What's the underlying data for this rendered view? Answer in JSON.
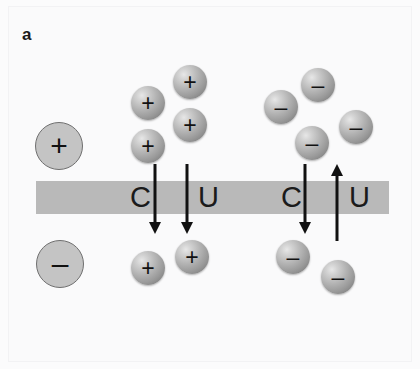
{
  "figure": {
    "panel_letter": "a",
    "background_color": "#fafafb",
    "membrane": {
      "label": "membrane",
      "color": "#b9b9b9",
      "x": 36,
      "y": 181,
      "width": 353,
      "height": 33
    }
  },
  "pathway_labels": [
    {
      "id": "left-c",
      "text": "C",
      "x": 130,
      "y": 183
    },
    {
      "id": "left-u",
      "text": "U",
      "x": 198,
      "y": 183
    },
    {
      "id": "right-c",
      "text": "C",
      "x": 281,
      "y": 183
    },
    {
      "id": "right-u",
      "text": "U",
      "x": 349,
      "y": 183
    }
  ],
  "arrows": [
    {
      "id": "arrow-left-c",
      "direction": "down",
      "x": 155,
      "y_top": 164,
      "y_bottom": 234
    },
    {
      "id": "arrow-left-u",
      "direction": "down",
      "x": 187,
      "y_top": 164,
      "y_bottom": 234
    },
    {
      "id": "arrow-right-c",
      "direction": "down",
      "x": 305,
      "y_top": 164,
      "y_bottom": 234
    },
    {
      "id": "arrow-right-u",
      "direction": "up",
      "x": 337,
      "y_top": 164,
      "y_bottom": 241
    }
  ],
  "ions": [
    {
      "id": "reservoir-positive",
      "charge": "+",
      "symbol": "+",
      "style": "flat",
      "size": "large",
      "cx": 58,
      "cy": 145,
      "r": 23
    },
    {
      "id": "reservoir-negative",
      "charge": "-",
      "symbol": "–",
      "style": "flat",
      "size": "large",
      "cx": 59,
      "cy": 263,
      "r": 23
    },
    {
      "id": "pos-upper-1",
      "charge": "+",
      "symbol": "+",
      "style": "shaded",
      "size": "small",
      "cx": 148,
      "cy": 103,
      "r": 17
    },
    {
      "id": "pos-upper-2",
      "charge": "+",
      "symbol": "+",
      "style": "shaded",
      "size": "small",
      "cx": 190,
      "cy": 82,
      "r": 17
    },
    {
      "id": "pos-upper-3",
      "charge": "+",
      "symbol": "+",
      "style": "shaded",
      "size": "small",
      "cx": 190,
      "cy": 125,
      "r": 17
    },
    {
      "id": "pos-upper-4",
      "charge": "+",
      "symbol": "+",
      "style": "shaded",
      "size": "small",
      "cx": 148,
      "cy": 146,
      "r": 17
    },
    {
      "id": "neg-upper-1",
      "charge": "-",
      "symbol": "–",
      "style": "shaded",
      "size": "small",
      "cx": 318,
      "cy": 85,
      "r": 17
    },
    {
      "id": "neg-upper-2",
      "charge": "-",
      "symbol": "–",
      "style": "shaded",
      "size": "small",
      "cx": 281,
      "cy": 107,
      "r": 17
    },
    {
      "id": "neg-upper-3",
      "charge": "-",
      "symbol": "–",
      "style": "shaded",
      "size": "small",
      "cx": 356,
      "cy": 127,
      "r": 17
    },
    {
      "id": "neg-upper-4",
      "charge": "-",
      "symbol": "–",
      "style": "shaded",
      "size": "small",
      "cx": 312,
      "cy": 143,
      "r": 17
    },
    {
      "id": "pos-lower-1",
      "charge": "+",
      "symbol": "+",
      "style": "shaded",
      "size": "small",
      "cx": 148,
      "cy": 268,
      "r": 17
    },
    {
      "id": "pos-lower-2",
      "charge": "+",
      "symbol": "+",
      "style": "shaded",
      "size": "small",
      "cx": 192,
      "cy": 257,
      "r": 17
    },
    {
      "id": "neg-lower-1",
      "charge": "-",
      "symbol": "–",
      "style": "shaded",
      "size": "small",
      "cx": 293,
      "cy": 257,
      "r": 17
    },
    {
      "id": "neg-lower-2",
      "charge": "-",
      "symbol": "–",
      "style": "shaded",
      "size": "small",
      "cx": 338,
      "cy": 277,
      "r": 17
    }
  ]
}
